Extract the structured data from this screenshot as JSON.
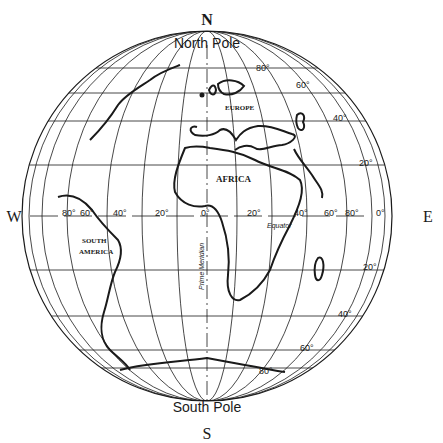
{
  "compass": {
    "north": "N",
    "south": "S",
    "west": "W",
    "east": "E"
  },
  "poles": {
    "north": "North Pole",
    "south": "South Pole"
  },
  "continents": {
    "europe": "EUROPE",
    "africa": "AFRICA",
    "south_america_1": "SOUTH",
    "south_america_2": "AMERICA"
  },
  "lines": {
    "equator": "Equator",
    "prime_meridian": "Prime Meridian"
  },
  "longitude_labels": [
    "80°",
    "60°",
    "40°",
    "20°",
    "0°",
    "20°",
    "40°",
    "60°",
    "80°",
    "0°"
  ],
  "latitude_labels": {
    "n80": "80°",
    "n60": "60°",
    "n40": "40°",
    "n20": "20°",
    "s20": "20°",
    "s40": "40°",
    "s60": "60°",
    "s80": "80°"
  },
  "colors": {
    "line": "#1a1a1a",
    "background": "#ffffff"
  }
}
